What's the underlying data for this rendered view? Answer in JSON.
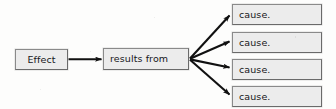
{
  "diagram": {
    "type": "cause-and-effect flowchart",
    "background_color": "#fdfdfc",
    "node_fill_color": "#ececec",
    "node_border_color": "#8a8a8a",
    "connector_color": "#111111",
    "effect": {
      "label": "Effect"
    },
    "relation": {
      "label": "results from"
    },
    "causes": [
      {
        "label": "cause."
      },
      {
        "label": "cause."
      },
      {
        "label": "cause."
      },
      {
        "label": "cause."
      }
    ],
    "connectors": [
      {
        "name": "effect-to-relation",
        "from": "Effect",
        "to": "results from",
        "style": "solid arrow"
      },
      {
        "name": "relation-to-cause-1",
        "from": "results from",
        "to": "cause.",
        "style": "solid arrow"
      },
      {
        "name": "relation-to-cause-2",
        "from": "results from",
        "to": "cause.",
        "style": "solid arrow"
      },
      {
        "name": "relation-to-cause-3",
        "from": "results from",
        "to": "cause.",
        "style": "solid arrow"
      },
      {
        "name": "relation-to-cause-4",
        "from": "results from",
        "to": "cause.",
        "style": "solid arrow"
      }
    ]
  }
}
